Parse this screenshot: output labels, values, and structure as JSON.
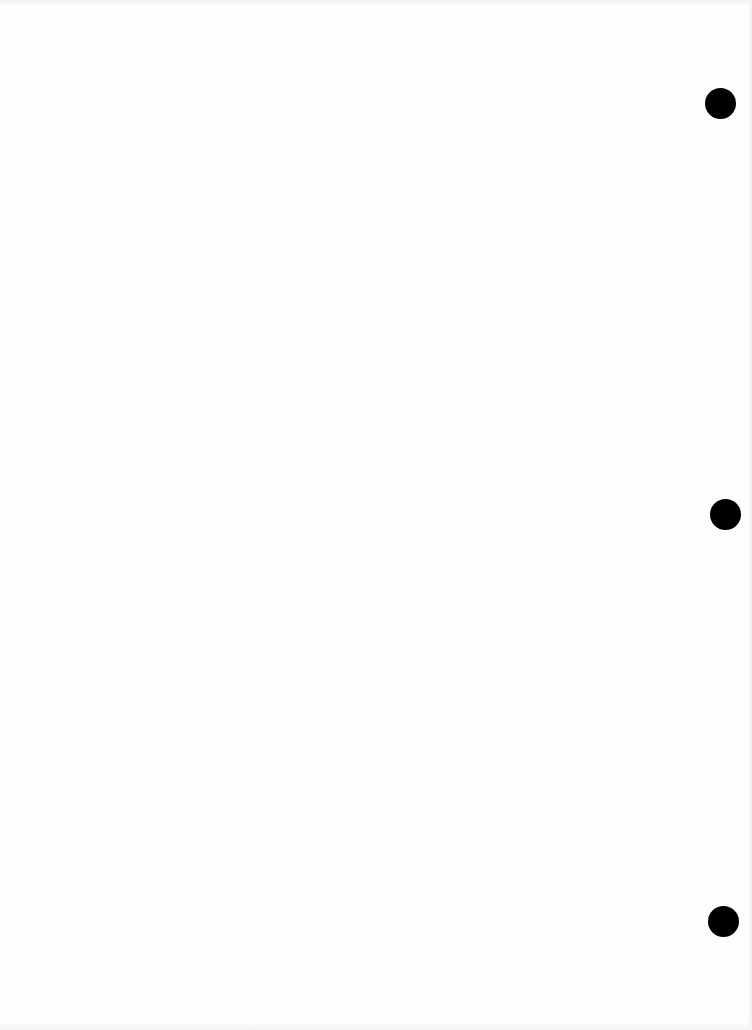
{
  "page": {
    "type": "blank scanned page",
    "background": "#fefefe",
    "punch_holes": [
      {
        "cx": 720,
        "cy": 103,
        "d": 31,
        "color": "#000000"
      },
      {
        "cx": 725,
        "cy": 514,
        "d": 31,
        "color": "#000000"
      },
      {
        "cx": 723,
        "cy": 921,
        "d": 31,
        "color": "#000000"
      }
    ]
  }
}
